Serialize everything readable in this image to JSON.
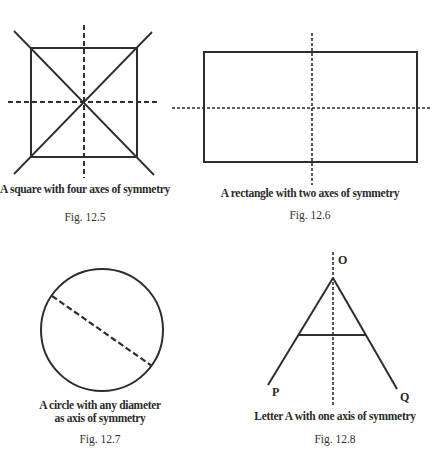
{
  "figures": [
    {
      "id": "fig-12-5",
      "shape": "square",
      "caption": "A square with four axes of symmetry",
      "fig_label": "Fig. 12.5",
      "axes_of_symmetry": 4
    },
    {
      "id": "fig-12-6",
      "shape": "rectangle",
      "caption": "A rectangle with two axes of symmetry",
      "fig_label": "Fig. 12.6",
      "axes_of_symmetry": 2
    },
    {
      "id": "fig-12-7",
      "shape": "circle",
      "caption_line1": "A circle with any diameter",
      "caption_line2": "as axis of symmetry",
      "fig_label": "Fig. 12.7",
      "axes_of_symmetry": "any diameter"
    },
    {
      "id": "fig-12-8",
      "shape": "letter A",
      "caption": "Letter A with one axis of symmetry",
      "fig_label": "Fig. 12.8",
      "axes_of_symmetry": 1,
      "point_labels": {
        "top": "O",
        "left": "P",
        "right": "Q"
      }
    }
  ],
  "colors": {
    "line": "#2e2e2e",
    "background": "#ffffff"
  }
}
